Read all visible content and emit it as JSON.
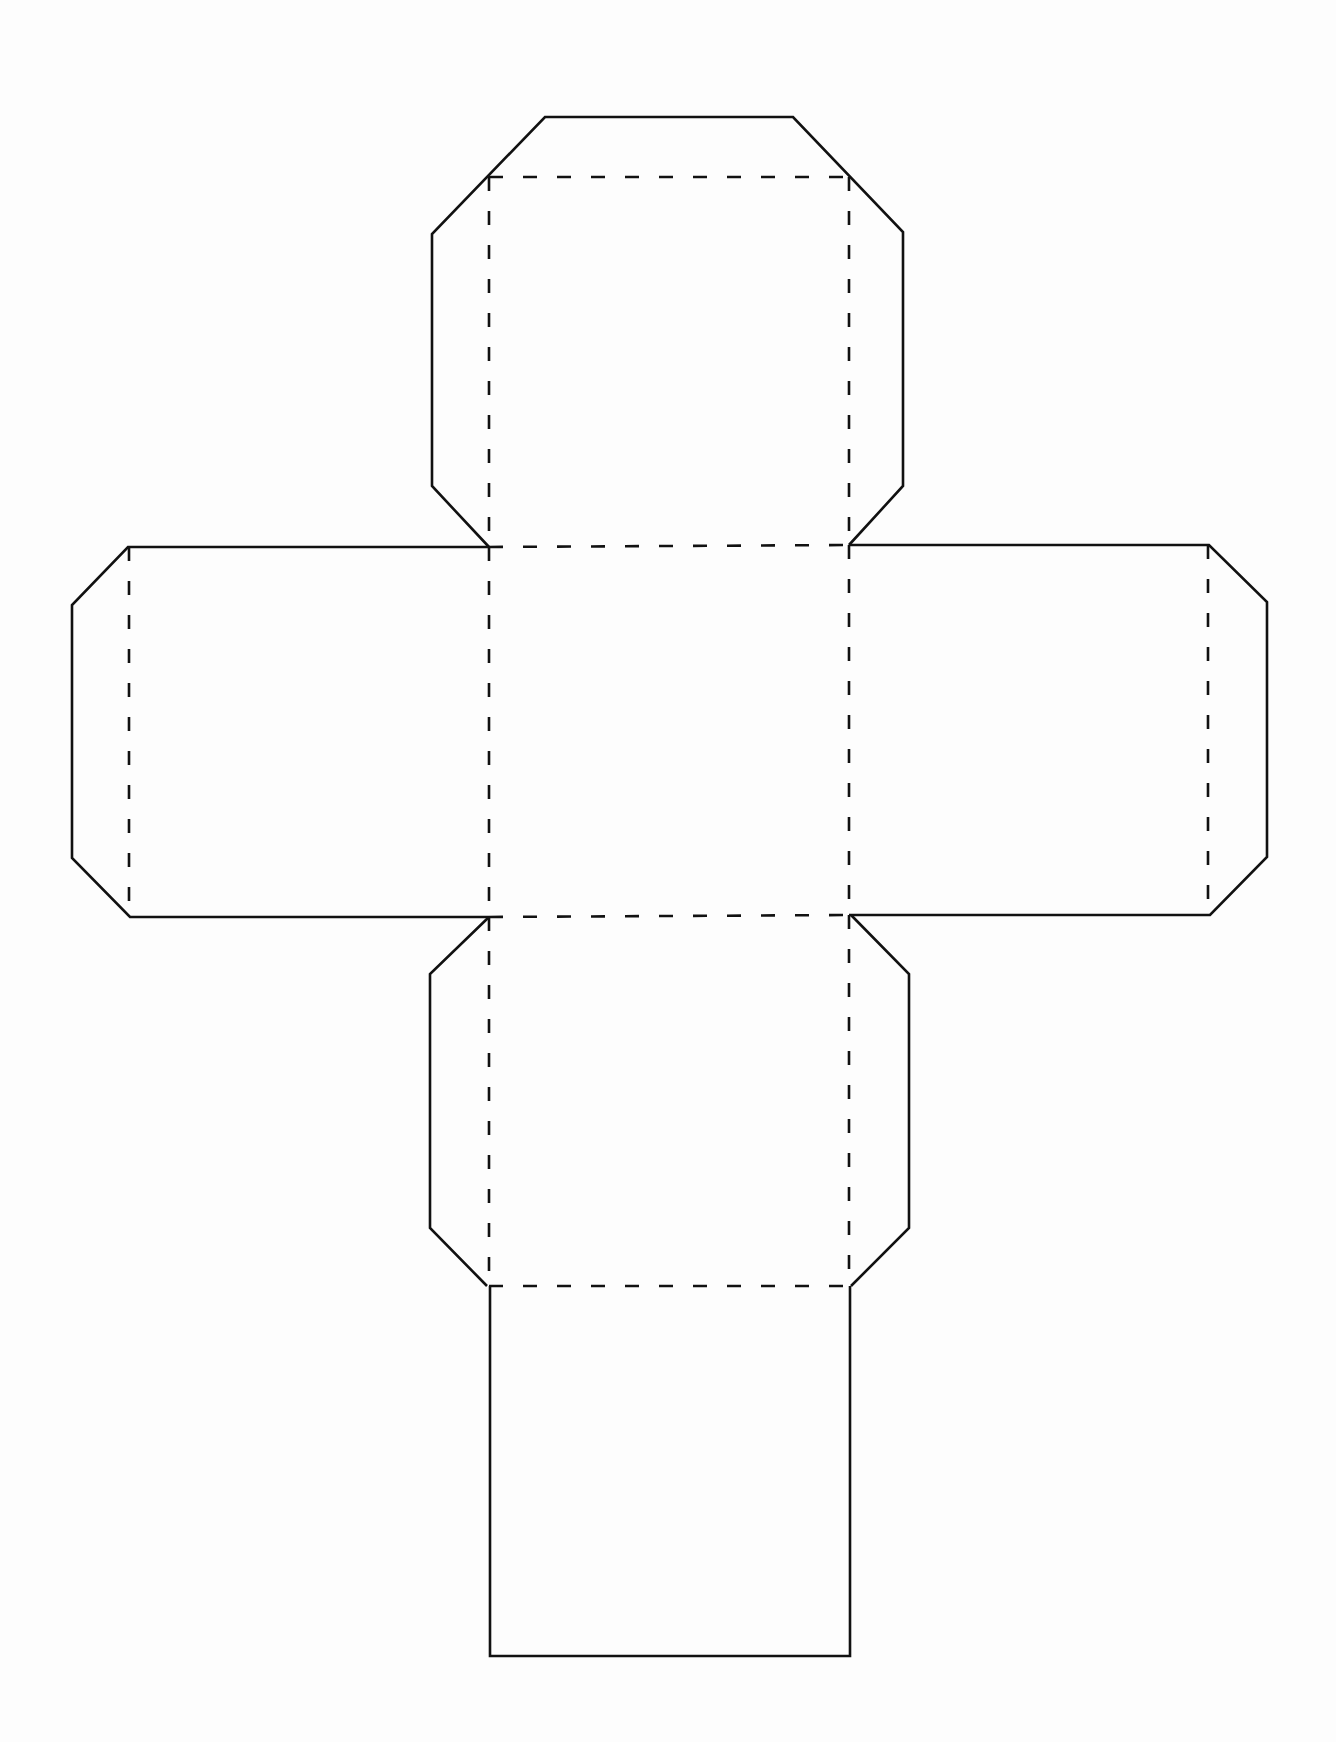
{
  "diagram": {
    "type": "cube-net",
    "colors": {
      "background": "#fdfdfd",
      "line": "#111111"
    },
    "legend": {
      "solid": "cut line",
      "dashed": "fold line"
    },
    "faces": [
      {
        "name": "top-face",
        "with_tabs": true
      },
      {
        "name": "left-face",
        "with_tabs": true
      },
      {
        "name": "center-face",
        "with_tabs": false
      },
      {
        "name": "right-face",
        "with_tabs": true
      },
      {
        "name": "bottom-face",
        "with_tabs": true
      },
      {
        "name": "back-face",
        "with_tabs": false
      }
    ]
  }
}
